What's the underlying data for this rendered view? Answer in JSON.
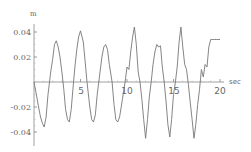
{
  "chart_data": {
    "type": "line",
    "title": "",
    "xlabel": "sec",
    "ylabel": "m",
    "xlim": [
      0,
      21
    ],
    "ylim": [
      -0.045,
      0.045
    ],
    "grid": false,
    "legend": null,
    "x_ticks": [
      {
        "value": 5,
        "label": "5"
      },
      {
        "value": 10,
        "label": "10"
      },
      {
        "value": 15,
        "label": "15"
      },
      {
        "value": 20,
        "label": "20"
      }
    ],
    "y_ticks": [
      {
        "value": 0.04,
        "label": "0.04"
      },
      {
        "value": 0.02,
        "label": "0.02"
      },
      {
        "value": -0.02,
        "label": "-0.02"
      },
      {
        "value": -0.04,
        "label": "-0.04"
      }
    ],
    "series": [
      {
        "name": "displacement",
        "color": "#777777",
        "x": [
          0,
          0.3,
          0.5,
          0.7,
          0.9,
          1.1,
          1.3,
          1.5,
          1.8,
          2.0,
          2.2,
          2.4,
          2.6,
          2.8,
          3.0,
          3.2,
          3.4,
          3.6,
          3.8,
          4.0,
          4.2,
          4.4,
          4.6,
          4.8,
          5.0,
          5.3,
          5.5,
          5.7,
          6.0,
          6.2,
          6.4,
          6.6,
          6.8,
          7.0,
          7.3,
          7.5,
          7.7,
          7.9,
          8.1,
          8.4,
          8.6,
          8.8,
          9.0,
          9.2,
          9.5,
          9.8,
          10.0,
          10.2,
          10.4,
          10.6,
          10.8,
          11.0,
          11.2,
          11.4,
          11.6,
          11.8,
          12.0,
          12.2,
          12.4,
          12.6,
          12.8,
          13.0,
          13.2,
          13.4,
          13.6,
          13.8,
          14.0,
          14.2,
          14.4,
          14.6,
          14.8,
          15.0,
          15.2,
          15.4,
          15.6,
          15.8,
          16.0,
          16.2,
          16.4,
          16.6,
          16.8,
          17.0,
          17.2,
          17.4,
          17.6,
          17.8,
          18.0,
          18.2,
          18.4,
          18.6,
          18.8,
          19.0,
          19.2,
          19.4,
          19.6,
          19.8,
          20.0
        ],
        "y": [
          0.0,
          -0.012,
          -0.02,
          -0.028,
          -0.033,
          -0.036,
          -0.028,
          -0.01,
          0.008,
          0.018,
          0.03,
          0.033,
          0.028,
          0.02,
          0.008,
          -0.006,
          -0.022,
          -0.03,
          -0.032,
          -0.022,
          -0.004,
          0.012,
          0.026,
          0.036,
          0.041,
          0.032,
          0.016,
          0.0,
          -0.02,
          -0.03,
          -0.032,
          -0.026,
          -0.01,
          0.002,
          0.02,
          0.028,
          0.03,
          0.026,
          0.014,
          0.0,
          -0.018,
          -0.03,
          -0.032,
          -0.028,
          -0.014,
          0.0,
          0.012,
          0.01,
          0.024,
          0.036,
          0.044,
          0.03,
          0.008,
          0.0,
          -0.014,
          -0.03,
          -0.045,
          -0.03,
          -0.012,
          0.0,
          0.014,
          0.024,
          0.03,
          0.028,
          0.029,
          0.012,
          0.0,
          -0.016,
          -0.034,
          -0.044,
          -0.03,
          -0.01,
          0.0,
          0.012,
          0.032,
          0.044,
          0.028,
          0.014,
          0.01,
          -0.002,
          -0.016,
          -0.03,
          -0.045,
          -0.034,
          -0.018,
          -0.006,
          0.01,
          0.004,
          0.014,
          0.012,
          0.028,
          0.034,
          0.034,
          0.034,
          0.034,
          0.034,
          0.034
        ]
      }
    ]
  },
  "axes": {
    "y_unit": "m",
    "x_unit": "sec",
    "y_labels": [
      "0.04",
      "0.02",
      "-0.02",
      "-0.04"
    ],
    "x_labels": [
      "5",
      "10",
      "15",
      "20"
    ]
  }
}
